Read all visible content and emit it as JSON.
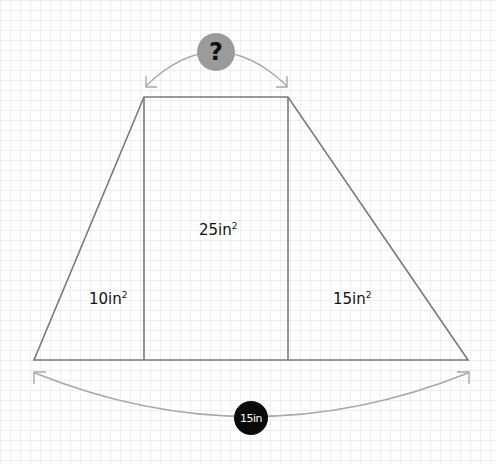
{
  "diagram": {
    "regions": [
      {
        "id": "left-triangle",
        "area_value": "10",
        "area_unit": "in",
        "exponent": "2"
      },
      {
        "id": "middle-rectangle",
        "area_value": "25",
        "area_unit": "in",
        "exponent": "2"
      },
      {
        "id": "right-triangle",
        "area_value": "15",
        "area_unit": "in",
        "exponent": "2"
      }
    ],
    "top_dimension": {
      "label": "?",
      "color": "#9b9b9b"
    },
    "bottom_dimension": {
      "label": "15in",
      "color": "#0a0a0a"
    },
    "colors": {
      "shape_stroke": "#7a7a7a",
      "arc_stroke": "#a8a8a8",
      "grid": "#eeeeee"
    }
  }
}
